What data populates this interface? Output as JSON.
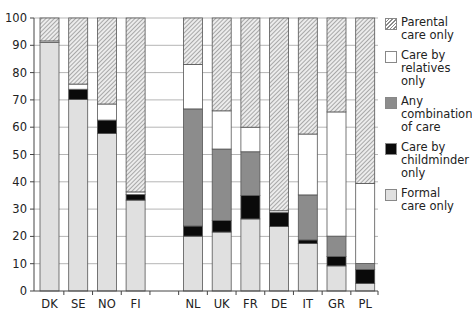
{
  "chart_data": {
    "type": "bar",
    "stacked": true,
    "title": "",
    "xlabel": "",
    "ylabel": "",
    "ylim": [
      0,
      100
    ],
    "yticks": [
      0,
      10,
      20,
      30,
      40,
      50,
      60,
      70,
      80,
      90,
      100
    ],
    "grid": true,
    "legend_position": "right",
    "categories": [
      "DK",
      "SE",
      "NO",
      "FI",
      "",
      "NL",
      "UK",
      "FR",
      "DE",
      "IT",
      "GR",
      "PL"
    ],
    "series": [
      {
        "name": "Formal care only",
        "key": "formal",
        "color": "#e0e0e0",
        "values": [
          91.0,
          70.2,
          57.7,
          33.3,
          null,
          20.1,
          21.6,
          26.4,
          23.6,
          17.4,
          9.2,
          2.8
        ]
      },
      {
        "name": "Care by childminder only",
        "key": "childminder",
        "color": "#0a0a0a",
        "values": [
          0.0,
          3.7,
          4.9,
          2.0,
          null,
          3.7,
          4.2,
          8.6,
          5.1,
          1.3,
          3.4,
          5.1
        ]
      },
      {
        "name": "Any combination of care",
        "key": "combination",
        "color": "#8c8c8c",
        "values": [
          0.0,
          0.0,
          0.0,
          0.0,
          null,
          42.9,
          26.2,
          16.0,
          0.0,
          16.5,
          7.5,
          2.2
        ]
      },
      {
        "name": "Care by relatives only",
        "key": "relatives",
        "color": "#ffffff",
        "values": [
          0.6,
          1.9,
          5.9,
          1.0,
          null,
          16.3,
          14.0,
          9.0,
          0.7,
          22.3,
          45.5,
          29.3
        ]
      },
      {
        "name": "Parental care only",
        "key": "parental",
        "color": "hatched",
        "values": [
          8.4,
          24.2,
          31.5,
          63.7,
          null,
          17.0,
          34.0,
          40.0,
          70.6,
          42.5,
          34.4,
          60.6
        ]
      }
    ]
  },
  "legend": {
    "items": [
      {
        "key": "parental",
        "label": "Parental care only"
      },
      {
        "key": "relatives",
        "label": "Care by relatives only"
      },
      {
        "key": "combination",
        "label": "Any combination of care"
      },
      {
        "key": "childminder",
        "label": "Care by childminder only"
      },
      {
        "key": "formal",
        "label": "Formal care only"
      }
    ]
  }
}
